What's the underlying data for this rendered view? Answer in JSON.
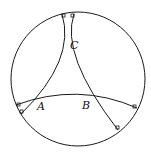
{
  "diagram": {
    "type": "hyperbolic-triangle-poincare-disk",
    "vertices": [
      {
        "id": "A",
        "label": "A"
      },
      {
        "id": "B",
        "label": "B"
      },
      {
        "id": "C",
        "label": "C"
      }
    ],
    "colors": {
      "stroke": "#1a1a1a",
      "background": "#ffffff"
    },
    "right_angle_markers": 6
  }
}
